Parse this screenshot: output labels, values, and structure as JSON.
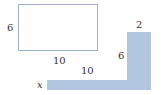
{
  "diagram": {
    "rectangle": {
      "height_label": "6",
      "width_label": "10"
    },
    "l_shape": {
      "top_width_label": "2",
      "vertical_height_label": "6",
      "horizontal_length_label": "10",
      "thickness_label": "x",
      "fill_color": "#b3c6e0"
    }
  }
}
